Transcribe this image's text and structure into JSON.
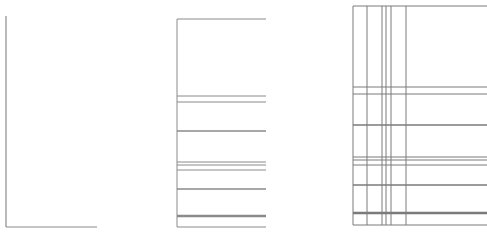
{
  "diagram": {
    "panels": [
      {
        "id": "axes-only",
        "description": "L-shaped axes",
        "stroke": "#8a8a8a",
        "vertical_axis": {
          "x": 6,
          "y1": 16,
          "y2": 227
        },
        "horizontal_axis": {
          "x1": 6,
          "x2": 97,
          "y": 227
        }
      },
      {
        "id": "horizontal-lines",
        "description": "Box with horizontal lines",
        "stroke": "#8a8a8a",
        "left_x": 177,
        "right_x": 266,
        "top_y": 19,
        "bottom_y": 227,
        "h_lines": [
          {
            "y": 96,
            "w": 1
          },
          {
            "y": 102,
            "w": 1
          },
          {
            "y": 131,
            "w": 1.5
          },
          {
            "y": 162,
            "w": 1
          },
          {
            "y": 165,
            "w": 1
          },
          {
            "y": 170,
            "w": 1
          },
          {
            "y": 189,
            "w": 1.5
          },
          {
            "y": 216,
            "w": 2.5
          }
        ]
      },
      {
        "id": "grid-lines",
        "description": "Box with horizontal and vertical grid lines",
        "stroke": "#7a7a7a",
        "left_x": 353,
        "right_x": 487,
        "top_y": 6,
        "bottom_y": 225,
        "v_lines": [
          367,
          382,
          386,
          391,
          406
        ],
        "h_lines": [
          {
            "y": 87,
            "w": 1
          },
          {
            "y": 94,
            "w": 1
          },
          {
            "y": 125,
            "w": 1.5
          },
          {
            "y": 157,
            "w": 1
          },
          {
            "y": 160,
            "w": 1
          },
          {
            "y": 165,
            "w": 1
          },
          {
            "y": 185,
            "w": 1.5
          },
          {
            "y": 213,
            "w": 2.5
          }
        ]
      }
    ]
  }
}
